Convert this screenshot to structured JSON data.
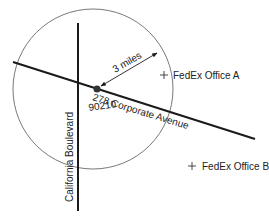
{
  "diagram": {
    "radius_label": "3 miles",
    "address_line1": "278 Corporate Avenue",
    "address_line2": "90210",
    "street_vertical": "California Boulevard",
    "office_a": "FedEx Office A",
    "office_b": "FedEx Office B",
    "colors": {
      "line": "#1a1a1a",
      "circle": "#555555",
      "marker": "#333333",
      "text": "#222222"
    }
  }
}
